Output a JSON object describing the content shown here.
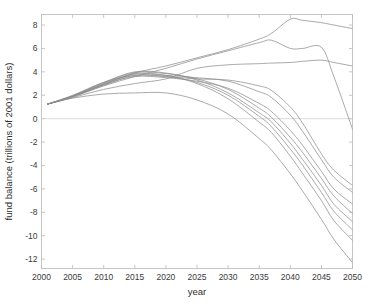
{
  "chart_data": {
    "type": "line",
    "title": "",
    "xlabel": "year",
    "ylabel": "fund balance (trillions of 2001 dollars)",
    "xlim": [
      2000,
      2050
    ],
    "ylim": [
      -12.8,
      8.9
    ],
    "xticks": [
      2000,
      2005,
      2010,
      2015,
      2020,
      2025,
      2030,
      2035,
      2040,
      2045,
      2050
    ],
    "yticks": [
      8,
      6,
      4,
      2,
      0,
      -2,
      -4,
      -6,
      -8,
      -10,
      -12
    ],
    "xtick_labels": [
      "2000",
      "2005",
      "2010",
      "2015",
      "2020",
      "2025",
      "2030",
      "2035",
      "2040",
      "2045",
      "2050"
    ],
    "ytick_labels": [
      "8",
      "6",
      "4",
      "2",
      "0",
      "-2",
      "-4",
      "-6",
      "-8",
      "-10",
      "-12"
    ],
    "grid": false,
    "legend": "none",
    "zero_reference_line": 0,
    "line_color": "#8d8d8d",
    "x": [
      2001,
      2005,
      2010,
      2015,
      2020,
      2025,
      2030,
      2035,
      2037,
      2040,
      2042,
      2045,
      2047,
      2050
    ],
    "series": [
      {
        "name": "run-1-high-surplus",
        "values": [
          1.25,
          1.9,
          2.9,
          3.9,
          4.5,
          5.2,
          5.9,
          6.8,
          7.3,
          8.5,
          8.4,
          8.2,
          8.0,
          7.7
        ]
      },
      {
        "name": "run-2-peak-2037-then-collapse",
        "values": [
          1.25,
          1.85,
          2.8,
          3.6,
          4.3,
          5.1,
          5.8,
          6.5,
          6.7,
          6.0,
          6.0,
          6.1,
          3.6,
          -0.9
        ]
      },
      {
        "name": "run-3-plateau",
        "values": [
          1.25,
          1.8,
          2.5,
          3.0,
          3.4,
          4.3,
          4.6,
          4.7,
          4.75,
          4.8,
          4.9,
          5.0,
          4.8,
          4.5
        ]
      },
      {
        "name": "run-4-decline-mild",
        "values": [
          1.25,
          2.0,
          3.1,
          3.7,
          3.6,
          3.4,
          3.3,
          2.8,
          2.4,
          1.0,
          -0.4,
          -3.0,
          -4.4,
          -5.7
        ]
      },
      {
        "name": "run-5-decline",
        "values": [
          1.25,
          1.95,
          3.0,
          3.8,
          3.7,
          3.5,
          3.2,
          2.3,
          1.8,
          0.3,
          -1.1,
          -3.5,
          -5.0,
          -6.3
        ]
      },
      {
        "name": "run-6-decline",
        "values": [
          1.25,
          1.9,
          2.9,
          3.6,
          3.5,
          3.2,
          2.6,
          1.3,
          0.6,
          -1.0,
          -2.3,
          -4.5,
          -6.0,
          -7.3
        ]
      },
      {
        "name": "run-7-decline-steep",
        "values": [
          1.25,
          1.92,
          3.1,
          4.0,
          3.9,
          3.3,
          2.2,
          0.5,
          -0.3,
          -2.1,
          -3.5,
          -5.7,
          -7.3,
          -8.8
        ]
      },
      {
        "name": "run-8-decline-steep",
        "values": [
          1.25,
          1.88,
          2.85,
          3.7,
          3.6,
          3.1,
          2.0,
          0.2,
          -0.7,
          -2.6,
          -4.0,
          -6.3,
          -7.9,
          -9.5
        ]
      },
      {
        "name": "run-9-decline-steeper",
        "values": [
          1.25,
          1.9,
          2.95,
          3.85,
          3.7,
          3.0,
          1.7,
          -0.3,
          -1.2,
          -3.2,
          -4.7,
          -7.0,
          -8.7,
          -10.4
        ]
      },
      {
        "name": "run-10-low-peak-steepest",
        "values": [
          1.25,
          1.75,
          2.1,
          2.2,
          2.2,
          1.6,
          0.4,
          -1.7,
          -2.7,
          -4.7,
          -6.2,
          -8.6,
          -10.3,
          -12.3
        ]
      },
      {
        "name": "run-11-decline",
        "values": [
          1.25,
          1.93,
          3.05,
          3.95,
          3.85,
          3.4,
          2.5,
          0.9,
          0.1,
          -1.6,
          -2.9,
          -5.1,
          -6.6,
          -8.1
        ]
      }
    ]
  },
  "axis": {
    "xlabel": "year",
    "ylabel": "fund balance (trillions of 2001 dollars)"
  }
}
